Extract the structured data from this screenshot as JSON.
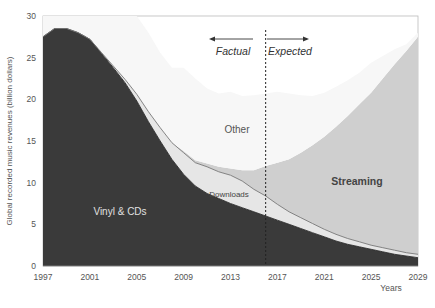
{
  "chart_data": {
    "type": "area",
    "stacked": true,
    "title": "",
    "xlabel": "Years",
    "ylabel": "Global recorded music revenues (billion dollars)",
    "xlim": [
      1997,
      2029
    ],
    "ylim": [
      0,
      30
    ],
    "x_ticks": [
      "1997",
      "2001",
      "2005",
      "2009",
      "2013",
      "2017",
      "2021",
      "2025",
      "2029"
    ],
    "y_ticks": [
      "0",
      "5",
      "10",
      "15",
      "20",
      "25",
      "30"
    ],
    "grid": false,
    "legend": "inline labels",
    "x": [
      1997,
      1998,
      1999,
      2000,
      2001,
      2002,
      2003,
      2004,
      2005,
      2006,
      2007,
      2008,
      2009,
      2010,
      2011,
      2012,
      2013,
      2014,
      2015,
      2016,
      2017,
      2018,
      2019,
      2020,
      2021,
      2022,
      2023,
      2024,
      2025,
      2026,
      2027,
      2028,
      2029
    ],
    "series": [
      {
        "name": "Vinyl & CDs",
        "color": "#3a3a3a",
        "values": [
          27.5,
          28.5,
          28.5,
          28.0,
          27.2,
          25.5,
          23.8,
          22.0,
          19.8,
          17.3,
          15.0,
          12.8,
          11.0,
          9.6,
          8.7,
          8.1,
          7.5,
          7.0,
          6.5,
          6.0,
          5.5,
          5.0,
          4.5,
          4.0,
          3.5,
          3.0,
          2.6,
          2.3,
          2.0,
          1.7,
          1.4,
          1.2,
          1.0
        ]
      },
      {
        "name": "Downloads",
        "color": "#e6e6e6",
        "values": [
          0,
          0,
          0,
          0,
          0,
          0.1,
          0.2,
          0.4,
          0.8,
          1.2,
          1.6,
          2.0,
          2.6,
          2.8,
          3.2,
          3.2,
          3.4,
          3.2,
          2.7,
          2.4,
          1.9,
          1.5,
          1.3,
          1.1,
          0.9,
          0.8,
          0.7,
          0.6,
          0.5,
          0.5,
          0.5,
          0.4,
          0.4
        ]
      },
      {
        "name": "Streaming",
        "color": "#cfcfcf",
        "values": [
          0,
          0,
          0,
          0,
          0,
          0,
          0,
          0,
          0,
          0,
          0,
          0,
          0.2,
          0.3,
          0.4,
          0.6,
          0.8,
          1.3,
          2.3,
          3.6,
          5.0,
          6.3,
          7.8,
          9.4,
          11.1,
          12.9,
          14.7,
          16.5,
          18.3,
          20.3,
          22.3,
          24.2,
          26.1
        ]
      },
      {
        "name": "Other",
        "color": "#f7f7f7",
        "values": [
          3.5,
          2.5,
          2.5,
          3.0,
          3.5,
          5.0,
          6.5,
          7.6,
          9.4,
          9.5,
          9.0,
          9.0,
          10.0,
          9.8,
          9.0,
          8.8,
          9.2,
          8.9,
          9.0,
          8.7,
          8.5,
          7.9,
          6.9,
          5.9,
          5.3,
          4.8,
          4.3,
          3.8,
          3.6,
          2.7,
          1.8,
          0.8,
          0.5
        ]
      }
    ],
    "annotations": [
      {
        "text": "Factual",
        "arrow": "left",
        "x": 2014
      },
      {
        "text": "Expected",
        "arrow": "right",
        "x": 2018.5
      },
      {
        "type": "vline",
        "x": 2016,
        "style": "dashed"
      }
    ]
  },
  "labels": {
    "vinyl": "Vinyl & CDs",
    "downloads": "Downloads",
    "streaming": "Streaming",
    "other": "Other",
    "factual": "Factual",
    "expected": "Expected",
    "xlabel": "Years",
    "ylabel": "Global recorded music revenues (billion dollars)",
    "caption": "Figure 3.1: Global recorded music revenues by format"
  }
}
